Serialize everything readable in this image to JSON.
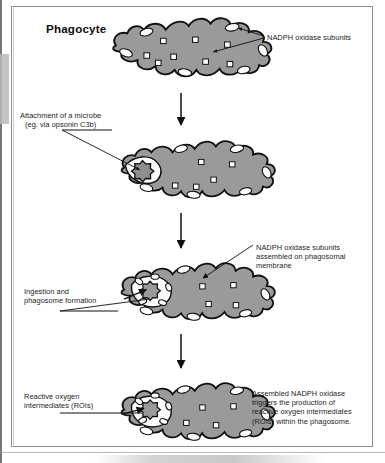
{
  "figure": {
    "title": "Phagocyte",
    "domain_kind": "biology process diagram",
    "panel_count": 4
  },
  "labels": {
    "nadph_subunits": "NADPH oxidase subunits",
    "attachment": "Attachment of a microbe\n(eg. via opsonin C3b)",
    "nadph_assembled": "NADPH oxidase subunits\nassembled on phagosomal\nmembrane",
    "ingestion": "Ingestion and\nphagosome formation",
    "roi": "Reactive oxygen\nintermediates (ROIs)",
    "assembled_triggers": "Assembled NADPH oxidase\ntriggers the production of\nreactive oxygen intermediates\n(ROIs) within the phagosome."
  },
  "panels": [
    {
      "index": 1,
      "name": "resting-phagocyte",
      "description": "Phagocyte with cytosolic NADPH oxidase subunits and membrane-bound subunits",
      "has_microbe": false,
      "has_phagosome": false
    },
    {
      "index": 2,
      "name": "microbe-attachment",
      "description": "Microbe attached to the phagocyte surface via opsonin C3b",
      "has_microbe": true,
      "has_phagosome": false
    },
    {
      "index": 3,
      "name": "ingestion-phagosome-formation",
      "description": "Microbe ingested, phagosome formed, oxidase subunits assembled on phagosomal membrane",
      "has_microbe": true,
      "has_phagosome": true
    },
    {
      "index": 4,
      "name": "roi-production",
      "description": "Assembled NADPH oxidase triggers reactive oxygen intermediates inside the phagosome",
      "has_microbe": true,
      "has_phagosome": true
    }
  ],
  "flow_arrows": [
    {
      "from_panel": 1,
      "to_panel": 2
    },
    {
      "from_panel": 2,
      "to_panel": 3
    },
    {
      "from_panel": 3,
      "to_panel": 4
    }
  ],
  "legend_symbols": [
    {
      "name": "cytosolic-subunit",
      "shape": "small white square",
      "meaning": "NADPH oxidase subunit in cytosol"
    },
    {
      "name": "membrane-subunit",
      "shape": "white ellipse on cell border",
      "meaning": "NADPH oxidase subunit in plasma membrane"
    },
    {
      "name": "microbe",
      "shape": "spiky gray circle",
      "meaning": "Microbe"
    },
    {
      "name": "phagosome",
      "shape": "white vacuole",
      "meaning": "Phagosome"
    }
  ],
  "colors": {
    "cytoplasm_fill": "#9a9a9a",
    "cell_outline": "#111111",
    "subunit_fill": "#ffffff",
    "microbe_fill": "#8e8e8e",
    "text": "#1c1c1c",
    "frame": "#8e8e8e",
    "page_background": "#ffffff"
  }
}
